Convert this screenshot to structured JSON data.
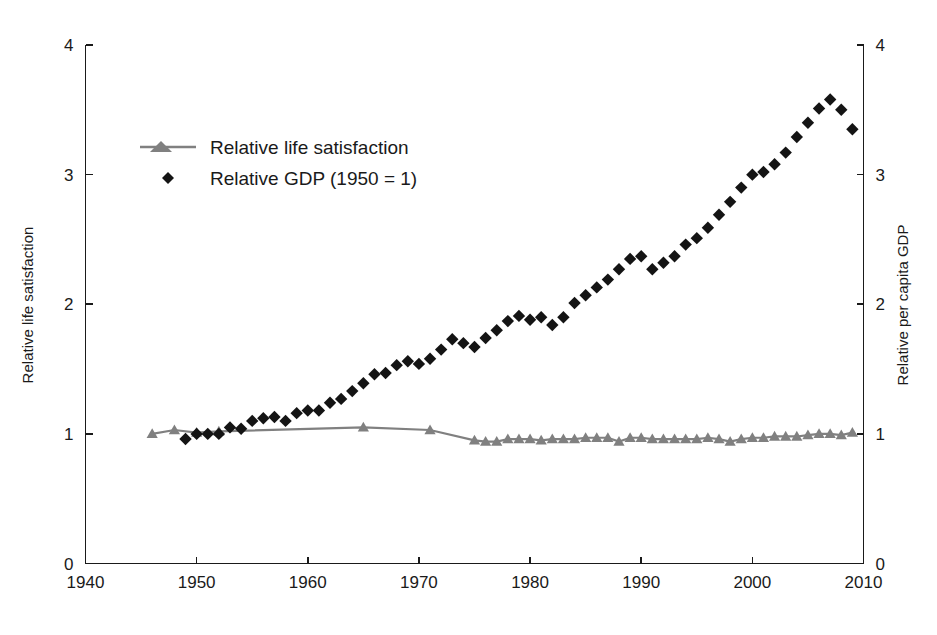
{
  "chart_data": {
    "type": "line",
    "title": "",
    "xlabel": "",
    "ylabel": "Relative life satisfaction",
    "y2label": "Relative per capita GDP",
    "xlim": [
      1940,
      2010
    ],
    "ylim": [
      0,
      4
    ],
    "y2lim": [
      0,
      4
    ],
    "xticks": [
      "1940",
      "1950",
      "1960",
      "1970",
      "1980",
      "1990",
      "2000",
      "2010"
    ],
    "xtick_values": [
      1940,
      1950,
      1960,
      1970,
      1980,
      1990,
      2000,
      2010
    ],
    "yticks": [
      "0",
      "1",
      "2",
      "3",
      "4"
    ],
    "ytick_values": [
      0,
      1,
      2,
      3,
      4
    ],
    "y2ticks": [
      "0",
      "1",
      "2",
      "3",
      "4"
    ],
    "y2tick_values": [
      0,
      1,
      2,
      3,
      4
    ],
    "grid": false,
    "legend_position": "upper-left",
    "legend": [
      {
        "label": "Relative life satisfaction",
        "marker": "triangle",
        "line": true,
        "color": "#808080"
      },
      {
        "label": "Relative GDP (1950 = 1)",
        "marker": "diamond",
        "line": false,
        "color": "#141414"
      }
    ],
    "series": [
      {
        "name": "Relative life satisfaction",
        "marker": "triangle",
        "line": true,
        "color": "#808080",
        "x": [
          1946,
          1948,
          1950,
          1952,
          1965,
          1971,
          1975,
          1976,
          1977,
          1978,
          1979,
          1980,
          1981,
          1982,
          1983,
          1984,
          1985,
          1986,
          1987,
          1988,
          1989,
          1990,
          1991,
          1992,
          1993,
          1994,
          1995,
          1996,
          1997,
          1998,
          1999,
          2000,
          2001,
          2002,
          2003,
          2004,
          2005,
          2006,
          2007,
          2008,
          2009
        ],
        "y": [
          1.0,
          1.03,
          1.01,
          1.02,
          1.05,
          1.03,
          0.95,
          0.94,
          0.94,
          0.96,
          0.96,
          0.96,
          0.95,
          0.96,
          0.96,
          0.96,
          0.97,
          0.97,
          0.97,
          0.94,
          0.97,
          0.97,
          0.96,
          0.96,
          0.96,
          0.96,
          0.96,
          0.97,
          0.96,
          0.94,
          0.96,
          0.97,
          0.97,
          0.98,
          0.98,
          0.98,
          0.99,
          1.0,
          1.0,
          0.99,
          1.01
        ]
      },
      {
        "name": "Relative GDP (1950 = 1)",
        "marker": "diamond",
        "line": false,
        "color": "#141414",
        "x": [
          1949,
          1950,
          1951,
          1952,
          1953,
          1954,
          1955,
          1956,
          1957,
          1958,
          1959,
          1960,
          1961,
          1962,
          1963,
          1964,
          1965,
          1966,
          1967,
          1968,
          1969,
          1970,
          1971,
          1972,
          1973,
          1974,
          1975,
          1976,
          1977,
          1978,
          1979,
          1980,
          1981,
          1982,
          1983,
          1984,
          1985,
          1986,
          1987,
          1988,
          1989,
          1990,
          1991,
          1992,
          1993,
          1994,
          1995,
          1996,
          1997,
          1998,
          1999,
          2000,
          2001,
          2002,
          2003,
          2004,
          2005,
          2006,
          2007,
          2008,
          2009
        ],
        "y": [
          0.96,
          1.0,
          1.0,
          1.0,
          1.05,
          1.04,
          1.1,
          1.12,
          1.13,
          1.1,
          1.16,
          1.18,
          1.18,
          1.24,
          1.27,
          1.33,
          1.39,
          1.46,
          1.47,
          1.53,
          1.56,
          1.54,
          1.58,
          1.65,
          1.73,
          1.7,
          1.67,
          1.74,
          1.8,
          1.87,
          1.91,
          1.88,
          1.9,
          1.84,
          1.9,
          2.01,
          2.07,
          2.13,
          2.19,
          2.27,
          2.35,
          2.37,
          2.27,
          2.32,
          2.37,
          2.46,
          2.51,
          2.59,
          2.69,
          2.79,
          2.9,
          3.0,
          3.02,
          3.08,
          3.17,
          3.29,
          3.4,
          3.51,
          3.58,
          3.5,
          3.35
        ]
      }
    ]
  },
  "axes": {
    "left_title": "Relative life satisfaction",
    "right_title": "Relative per capita GDP"
  },
  "legend": {
    "item_life_satisfaction": "Relative life satisfaction",
    "item_gdp": "Relative GDP (1950 = 1)"
  },
  "colors": {
    "life_satisfaction": "#808080",
    "gdp": "#141414",
    "axis": "#1a1a1a",
    "background": "#ffffff"
  }
}
